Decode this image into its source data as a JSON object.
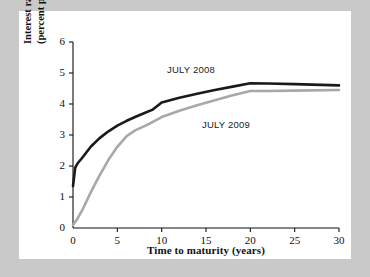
{
  "figure": {
    "background_color": "#c9c9c9",
    "card_color": "#ffffff"
  },
  "chart_data": {
    "type": "line",
    "title": "",
    "subtitle": "",
    "xlabel": "Time to maturity (years)",
    "ylabel": "Interest rate (percent per year)",
    "ylabel_lines": [
      "Interest rate",
      "(percent per year)"
    ],
    "xlim": [
      0,
      30
    ],
    "ylim": [
      0,
      6
    ],
    "xticks": [
      0,
      5,
      10,
      15,
      20,
      25,
      30
    ],
    "yticks": [
      0,
      1,
      2,
      3,
      4,
      5,
      6
    ],
    "xtick_labels": [
      "0",
      "5",
      "10",
      "15",
      "20",
      "25",
      "30"
    ],
    "ytick_labels": [
      "0",
      "1",
      "2",
      "3",
      "4",
      "5",
      "6"
    ],
    "grid": false,
    "legend_position": "inline-annotations",
    "series": [
      {
        "name": "JULY 2008",
        "color": "#1a1a1a",
        "line_width": 2.6,
        "x": [
          0,
          0.25,
          0.5,
          1,
          2,
          3,
          4,
          5,
          6,
          7,
          8,
          9,
          10,
          12,
          14,
          16,
          18,
          20,
          22,
          25,
          30
        ],
        "values": [
          1.35,
          1.95,
          2.08,
          2.25,
          2.62,
          2.9,
          3.12,
          3.3,
          3.45,
          3.58,
          3.7,
          3.82,
          4.05,
          4.2,
          4.33,
          4.45,
          4.56,
          4.67,
          4.66,
          4.64,
          4.6
        ]
      },
      {
        "name": "JULY 2009",
        "color": "#a8a8a8",
        "line_width": 2.6,
        "x": [
          0,
          0.25,
          0.5,
          1,
          2,
          3,
          4,
          5,
          6,
          7,
          8,
          9,
          10,
          12,
          14,
          16,
          18,
          20,
          22,
          25,
          30
        ],
        "values": [
          0.1,
          0.2,
          0.3,
          0.55,
          1.15,
          1.7,
          2.2,
          2.62,
          2.95,
          3.15,
          3.28,
          3.42,
          3.58,
          3.78,
          3.96,
          4.12,
          4.28,
          4.42,
          4.42,
          4.43,
          4.45
        ]
      }
    ],
    "annotations": [
      {
        "text": "JULY 2008",
        "x": 13.5,
        "y": 5.25
      },
      {
        "text": "JULY 2009",
        "x": 17.0,
        "y": 3.45
      }
    ]
  }
}
